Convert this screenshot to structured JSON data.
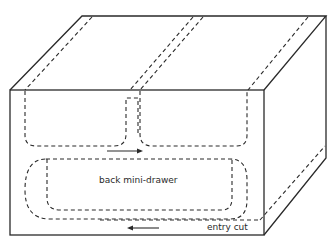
{
  "diagram": {
    "type": "isometric-box-tunnel-diagram",
    "labels": {
      "back_mini_drawer": "back mini-drawer",
      "entry_cut": "entry cut"
    },
    "colors": {
      "line": "#2a2a2a",
      "background": "#ffffff"
    },
    "elements": [
      {
        "name": "box-front-face",
        "kind": "solid-rectangle"
      },
      {
        "name": "box-top-face",
        "kind": "solid-parallelogram"
      },
      {
        "name": "box-right-face",
        "kind": "solid-parallelogram"
      },
      {
        "name": "left-upper-tunnel",
        "kind": "dashed-rounded-loop"
      },
      {
        "name": "right-upper-tunnel",
        "kind": "dashed-rounded-loop"
      },
      {
        "name": "back-mini-drawer-loop",
        "kind": "dashed-rounded-loop"
      },
      {
        "name": "entry-cut-path",
        "kind": "dashed-line"
      },
      {
        "name": "upper-arrow",
        "direction": "right"
      },
      {
        "name": "lower-arrow",
        "direction": "left"
      }
    ]
  }
}
